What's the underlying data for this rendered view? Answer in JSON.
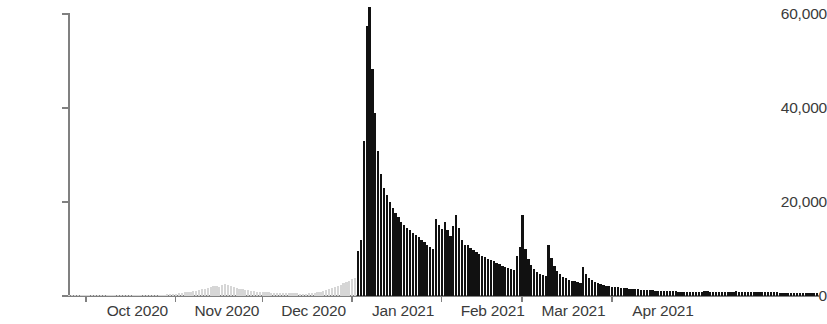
{
  "chart_data": {
    "type": "bar",
    "title": "",
    "subtitle": "",
    "xlabel": "",
    "ylabel": "",
    "ylim": [
      0,
      63000
    ],
    "yticks": [
      0,
      20000,
      40000,
      60000
    ],
    "ytick_labels": [
      "0",
      "20,000",
      "40,000",
      "60,000"
    ],
    "xtick_labels": [
      "Oct 2020",
      "Nov 2020",
      "Dec 2020",
      "Jan 2021",
      "Feb 2021",
      "Mar 2021",
      "Apr 2021"
    ],
    "grid": false,
    "legend": null,
    "bar_color": "#111111",
    "faded_bar_color": "#d6d6d6",
    "axis_color": "#808080",
    "text_color": "#3b3b3b",
    "x_start": "2020-09-25",
    "x_end": "2021-04-25",
    "series": [
      {
        "name": "Daily count",
        "note": "Values prior to 2021-01-02 are rendered in light gray (faded); from 2021-01-02 onward rendered in near-black.",
        "faded_until_index": 99,
        "values": [
          40,
          60,
          50,
          70,
          80,
          60,
          90,
          70,
          60,
          80,
          100,
          90,
          70,
          110,
          120,
          100,
          90,
          130,
          140,
          120,
          150,
          170,
          140,
          160,
          190,
          210,
          180,
          200,
          230,
          260,
          240,
          280,
          320,
          300,
          360,
          420,
          480,
          520,
          600,
          700,
          760,
          840,
          900,
          1000,
          1150,
          1300,
          1450,
          1600,
          1800,
          2000,
          2200,
          2100,
          1900,
          2300,
          2500,
          2400,
          2200,
          2000,
          1800,
          1600,
          1400,
          1300,
          1200,
          1100,
          1000,
          950,
          900,
          850,
          800,
          760,
          720,
          700,
          680,
          660,
          640,
          620,
          600,
          580,
          560,
          540,
          520,
          500,
          520,
          560,
          600,
          680,
          760,
          900,
          1100,
          1300,
          1500,
          1700,
          1900,
          2100,
          2400,
          2700,
          3000,
          3300,
          3600,
          3900,
          9600,
          12000,
          33000,
          57600,
          61700,
          48500,
          39000,
          31000,
          26000,
          23000,
          21500,
          20000,
          18800,
          17800,
          16800,
          15900,
          15200,
          14600,
          14000,
          13500,
          13000,
          12500,
          12000,
          11500,
          11000,
          10500,
          10100,
          16500,
          15200,
          14300,
          15800,
          14000,
          12800,
          15000,
          17200,
          14500,
          12000,
          11000,
          10800,
          10200,
          9800,
          9400,
          9000,
          8600,
          8300,
          8000,
          7700,
          7400,
          7100,
          6800,
          6500,
          6200,
          6000,
          5800,
          5600,
          8500,
          10500,
          17200,
          10000,
          7800,
          6600,
          5800,
          5200,
          4800,
          4500,
          4200,
          11000,
          8200,
          6500,
          5400,
          4600,
          4100,
          3800,
          3500,
          3300,
          3100,
          2900,
          2800,
          6100,
          4700,
          3900,
          3400,
          3000,
          2700,
          2500,
          2350,
          2200,
          2100,
          2000,
          1900,
          1820,
          1750,
          1680,
          1620,
          1560,
          1500,
          1450,
          1400,
          1360,
          1320,
          1280,
          1240,
          1200,
          1170,
          1140,
          1110,
          1080,
          1050,
          1020,
          1000,
          980,
          960,
          940,
          920,
          900,
          890,
          880,
          870,
          860,
          850,
          1050,
          1000,
          950,
          900,
          880,
          860,
          840,
          830,
          820,
          810,
          800,
          1000,
          950,
          900,
          880,
          860,
          850,
          840,
          830,
          820,
          810,
          800,
          790,
          780,
          770,
          760,
          750,
          740,
          730,
          720,
          710,
          700,
          690,
          680,
          670,
          660,
          650,
          640,
          630,
          620
        ]
      }
    ]
  }
}
